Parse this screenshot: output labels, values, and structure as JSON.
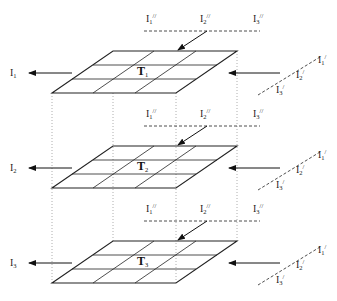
{
  "diagram": {
    "type": "layered-grid-stack",
    "layers": [
      {
        "name": "T1",
        "label": "T",
        "label_sub": "1",
        "output": {
          "label": "I",
          "sub": "1"
        },
        "top_inputs": [
          {
            "label": "I",
            "sub": "1",
            "prime": "//"
          },
          {
            "label": "I",
            "sub": "2",
            "prime": "//"
          },
          {
            "label": "I",
            "sub": "3",
            "prime": "//"
          }
        ],
        "side_inputs": [
          {
            "label": "I",
            "sub": "1",
            "prime": "/"
          },
          {
            "label": "I",
            "sub": "2",
            "prime": "/"
          },
          {
            "label": "I",
            "sub": "3",
            "prime": "/"
          }
        ]
      },
      {
        "name": "T2",
        "label": "T",
        "label_sub": "2",
        "output": {
          "label": "I",
          "sub": "2"
        },
        "top_inputs": [
          {
            "label": "I",
            "sub": "1",
            "prime": "//"
          },
          {
            "label": "I",
            "sub": "2",
            "prime": "//"
          },
          {
            "label": "I",
            "sub": "3",
            "prime": "//"
          }
        ],
        "side_inputs": [
          {
            "label": "I",
            "sub": "1",
            "prime": "/"
          },
          {
            "label": "I",
            "sub": "2",
            "prime": "/"
          },
          {
            "label": "I",
            "sub": "3",
            "prime": "/"
          }
        ]
      },
      {
        "name": "T3",
        "label": "T",
        "label_sub": "3",
        "output": {
          "label": "I",
          "sub": "3"
        },
        "top_inputs": [
          {
            "label": "I",
            "sub": "1",
            "prime": "//"
          },
          {
            "label": "I",
            "sub": "2",
            "prime": "//"
          },
          {
            "label": "I",
            "sub": "3",
            "prime": "//"
          }
        ],
        "side_inputs": [
          {
            "label": "I",
            "sub": "1",
            "prime": "/"
          },
          {
            "label": "I",
            "sub": "2",
            "prime": "/"
          },
          {
            "label": "I",
            "sub": "3",
            "prime": "/"
          }
        ]
      }
    ],
    "grid_size": "3x3",
    "colors": {
      "line": "#222222",
      "dotted": "#999999",
      "background": "#ffffff"
    }
  }
}
